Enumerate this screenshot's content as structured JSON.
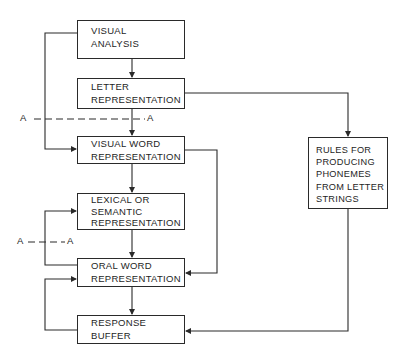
{
  "diagram": {
    "boxes": {
      "visual_analysis": {
        "lines": [
          "VISUAL",
          "ANALYSIS"
        ]
      },
      "letter_representation": {
        "lines": [
          "LETTER",
          "REPRESENTATION"
        ]
      },
      "visual_word_representation": {
        "lines": [
          "VISUAL WORD",
          "REPRESENTATION"
        ]
      },
      "lexical_semantic_representation": {
        "lines": [
          "LEXICAL OR",
          "SEMANTIC",
          "REPRESENTATION"
        ]
      },
      "oral_word_representation": {
        "lines": [
          "ORAL WORD",
          "REPRESENTATION"
        ]
      },
      "response_buffer": {
        "lines": [
          "RESPONSE",
          "BUFFER"
        ]
      },
      "rules_phonemes": {
        "lines": [
          "RULES FOR",
          "PRODUCING",
          "PHONEMES",
          "FROM LETTER",
          "STRINGS"
        ]
      }
    },
    "section_markers": {
      "upper_left": "A",
      "upper_right": "A",
      "lower_left": "A",
      "lower_right": "A"
    },
    "colors": {
      "line": "#2a2a2a",
      "text": "#1e1e1e",
      "background": "#ffffff"
    }
  }
}
